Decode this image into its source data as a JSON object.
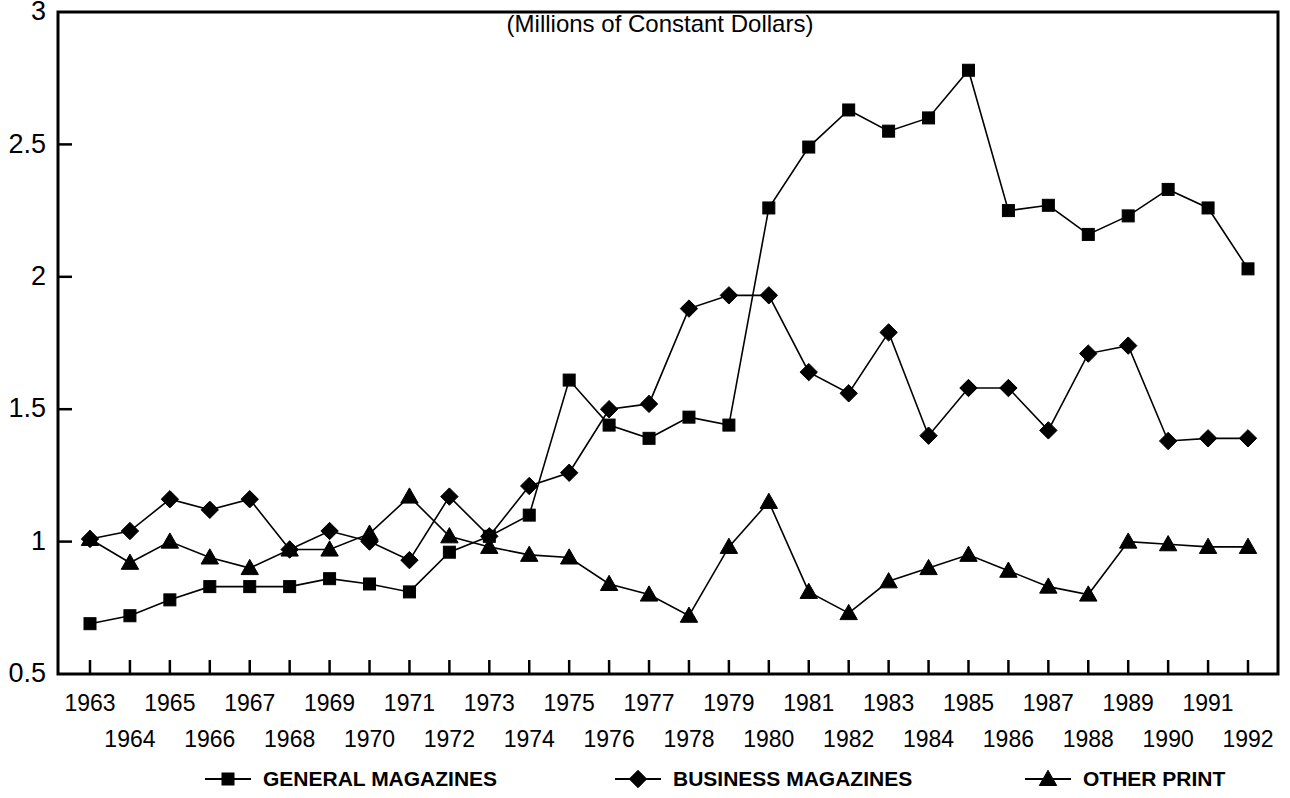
{
  "chart_data": {
    "type": "line",
    "title": "(Millions of Constant Dollars)",
    "xlabel": "",
    "ylabel": "",
    "ylim": [
      0.5,
      3
    ],
    "yticks": [
      0.5,
      1,
      1.5,
      2,
      2.5,
      3
    ],
    "ytick_labels": [
      "0.5",
      "1",
      "1.5",
      "2",
      "2.5",
      "3"
    ],
    "grid": false,
    "legend_position": "bottom",
    "categories": [
      "1963",
      "1964",
      "1965",
      "1966",
      "1967",
      "1968",
      "1969",
      "1970",
      "1971",
      "1972",
      "1973",
      "1974",
      "1975",
      "1976",
      "1977",
      "1978",
      "1979",
      "1980",
      "1981",
      "1982",
      "1983",
      "1984",
      "1985",
      "1986",
      "1987",
      "1988",
      "1989",
      "1990",
      "1991",
      "1992"
    ],
    "x_axis_top_labels": [
      "1963",
      "1965",
      "1967",
      "1969",
      "1971",
      "1973",
      "1975",
      "1977",
      "1979",
      "1981",
      "1983",
      "1985",
      "1987",
      "1989",
      "1991"
    ],
    "x_axis_bottom_labels": [
      "1964",
      "1966",
      "1968",
      "1970",
      "1972",
      "1974",
      "1976",
      "1978",
      "1980",
      "1982",
      "1984",
      "1986",
      "1988",
      "1990",
      "1992"
    ],
    "series": [
      {
        "name": "GENERAL MAGAZINES",
        "marker": "square",
        "values": [
          0.69,
          0.72,
          0.78,
          0.83,
          0.83,
          0.83,
          0.86,
          0.84,
          0.81,
          0.96,
          1.02,
          1.1,
          1.61,
          1.44,
          1.39,
          1.47,
          1.44,
          2.26,
          2.49,
          2.63,
          2.55,
          2.6,
          2.78,
          2.25,
          2.27,
          2.16,
          2.23,
          2.33,
          2.26,
          2.03
        ]
      },
      {
        "name": "BUSINESS MAGAZINES",
        "marker": "diamond",
        "values": [
          1.01,
          1.04,
          1.16,
          1.12,
          1.16,
          0.97,
          1.04,
          1.0,
          0.93,
          1.17,
          1.02,
          1.21,
          1.26,
          1.5,
          1.52,
          1.88,
          1.93,
          1.93,
          1.64,
          1.56,
          1.79,
          1.4,
          1.58,
          1.58,
          1.42,
          1.71,
          1.74,
          1.38,
          1.39,
          1.39
        ]
      },
      {
        "name": "OTHER PRINT",
        "marker": "triangle",
        "values": [
          1.01,
          0.92,
          1.0,
          0.94,
          0.9,
          0.97,
          0.97,
          1.03,
          1.17,
          1.02,
          0.98,
          0.95,
          0.94,
          0.84,
          0.8,
          0.72,
          0.98,
          1.15,
          0.81,
          0.73,
          0.85,
          0.9,
          0.95,
          0.89,
          0.83,
          0.8,
          1.0,
          0.99,
          0.98,
          0.98
        ]
      }
    ],
    "series_note_overlaps": "1992 GENERAL MAGAZINES = 2.07; 1991 BUSINESS = 1.38; values at right edge",
    "legend": [
      {
        "label": "GENERAL MAGAZINES",
        "marker": "square"
      },
      {
        "label": "BUSINESS MAGAZINES",
        "marker": "diamond"
      },
      {
        "label": "OTHER PRINT",
        "marker": "triangle"
      }
    ],
    "colors": {
      "ink": "#000000",
      "background": "#ffffff"
    }
  }
}
